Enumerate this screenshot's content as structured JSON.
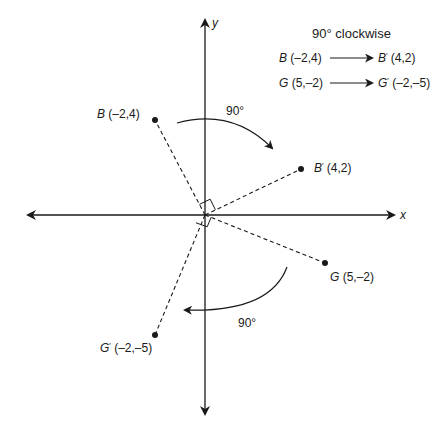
{
  "diagram": {
    "title": "90° clockwise",
    "axes": {
      "x_label": "x",
      "y_label": "y"
    },
    "mappings": [
      {
        "from_name": "B",
        "from_coords": "(–2,4)",
        "to_name": "B",
        "to_prime": "′",
        "to_coords": "(4,2)"
      },
      {
        "from_name": "G",
        "from_coords": "(5,–2)",
        "to_name": "G",
        "to_prime": "′",
        "to_coords": "(–2,–5)"
      }
    ],
    "points": {
      "B": {
        "name": "B",
        "coords": "(–2,4)"
      },
      "B_prime": {
        "name": "B",
        "prime": "′",
        "coords": "(4,2)"
      },
      "G": {
        "name": "G",
        "coords": "(5,–2)"
      },
      "G_prime": {
        "name": "G",
        "prime": "′",
        "coords": "(–2,–5)"
      }
    },
    "rotation_labels": {
      "upper": "90°",
      "lower": "90°"
    },
    "colors": {
      "ink": "#1a1a1a",
      "background": "#ffffff"
    }
  }
}
